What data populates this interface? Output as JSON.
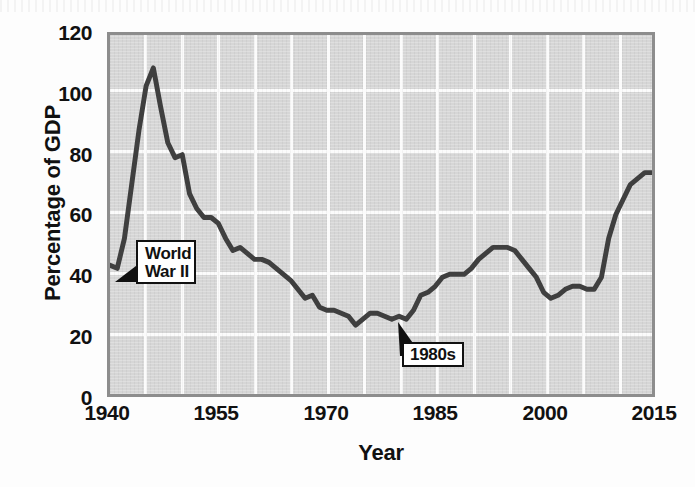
{
  "chart_data": {
    "type": "line",
    "title": "",
    "xlabel": "Year",
    "ylabel": "Percentage of GDP",
    "xlim": [
      1940,
      2015
    ],
    "ylim": [
      0,
      120
    ],
    "ytick_labels": [
      "0",
      "20",
      "40",
      "60",
      "80",
      "100",
      "120"
    ],
    "ytick_values": [
      0,
      20,
      40,
      60,
      80,
      100,
      120
    ],
    "xtick_labels": [
      "1940",
      "1955",
      "1970",
      "1985",
      "2000",
      "2015"
    ],
    "xtick_values": [
      1940,
      1955,
      1970,
      1985,
      2000,
      2015
    ],
    "grid": "both-axes-white-gridlines-every-5-years-and-every-20-percent",
    "legend": "none",
    "series": [
      {
        "name": "Federal debt held by the public as a percentage of GDP",
        "color": "#3f3f3f",
        "x": [
          1940,
          1941,
          1942,
          1943,
          1944,
          1945,
          1946,
          1947,
          1948,
          1949,
          1950,
          1951,
          1952,
          1953,
          1954,
          1955,
          1956,
          1957,
          1958,
          1959,
          1960,
          1961,
          1962,
          1963,
          1964,
          1965,
          1966,
          1967,
          1968,
          1969,
          1970,
          1971,
          1972,
          1973,
          1974,
          1975,
          1976,
          1977,
          1978,
          1979,
          1980,
          1981,
          1982,
          1983,
          1984,
          1985,
          1986,
          1987,
          1988,
          1989,
          1990,
          1991,
          1992,
          1993,
          1994,
          1995,
          1996,
          1997,
          1998,
          1999,
          2000,
          2001,
          2002,
          2003,
          2004,
          2005,
          2006,
          2007,
          2008,
          2009,
          2010,
          2011,
          2012,
          2013,
          2014,
          2015
        ],
        "y": [
          43,
          42,
          52,
          70,
          88,
          103,
          109,
          96,
          84,
          79,
          80,
          67,
          62,
          59,
          59,
          57,
          52,
          48,
          49,
          47,
          45,
          45,
          44,
          42,
          40,
          38,
          35,
          32,
          33,
          29,
          28,
          28,
          27,
          26,
          23,
          25,
          27,
          27,
          26,
          25,
          26,
          25,
          28,
          33,
          34,
          36,
          39,
          40,
          40,
          40,
          42,
          45,
          47,
          49,
          49,
          49,
          48,
          45,
          42,
          39,
          34,
          32,
          33,
          35,
          36,
          36,
          35,
          35,
          39,
          52,
          60,
          65,
          70,
          72,
          74,
          74
        ],
        "key_points": [
          {
            "year": 1940,
            "value": 43,
            "note": "series start"
          },
          {
            "year": 1941,
            "value": 42,
            "note": "low before WWII buildup"
          },
          {
            "year": 1946,
            "value": 109,
            "note": "World War II peak"
          },
          {
            "year": 1950,
            "value": 80,
            "note": "post-war shoulder"
          },
          {
            "year": 1974,
            "value": 23,
            "note": "historic low"
          },
          {
            "year": 1981,
            "value": 25,
            "note": "1980s trough before buildup"
          },
          {
            "year": 1994,
            "value": 49,
            "note": "mid-1990s peak"
          },
          {
            "year": 2001,
            "value": 32,
            "note": "turn-of-century low"
          },
          {
            "year": 2015,
            "value": 74,
            "note": "series end"
          }
        ]
      }
    ],
    "annotations": [
      {
        "id": "world-war-ii",
        "label": "World\nWar II",
        "points_to_year": 1941,
        "points_to_value": 43
      },
      {
        "id": "nineteen-eighties",
        "label": "1980s",
        "points_to_year": 1981,
        "points_to_value": 25
      }
    ]
  },
  "axes": {
    "y_title": "Percentage of GDP",
    "x_title": "Year"
  },
  "annotations": {
    "ww2_line1": "World",
    "ww2_line2": "War II",
    "eighties": "1980s"
  },
  "colors": {
    "plot_background": "#d6d6d6",
    "gridline": "#fbfbfb",
    "frame_border": "#8d8d8d",
    "series_line": "#3f3f3f",
    "text": "#111111",
    "callout_background": "#ffffff",
    "callout_border": "#111111"
  }
}
